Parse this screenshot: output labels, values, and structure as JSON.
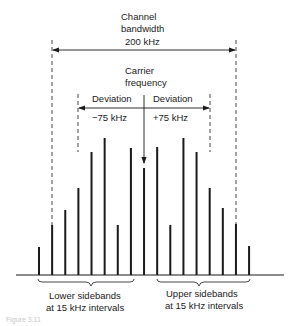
{
  "diagram": {
    "title_lines": [
      "Channel",
      "bandwidth",
      "200 kHz"
    ],
    "carrier_lines": [
      "Carrier",
      "frequency"
    ],
    "deviation_left": "Deviation",
    "deviation_right": "Deviation",
    "deviation_left_value": "−75 kHz",
    "deviation_right_value": "+75 kHz",
    "lower_sidebands_lines": [
      "Lower sidebands",
      "at 15 kHz intervals"
    ],
    "upper_sidebands_lines": [
      "Upper sidebands",
      "at 15 kHz intervals"
    ],
    "caption": "Figure 3.11",
    "colors": {
      "ink": "#1a1a1a",
      "caption": "#c8c8c8",
      "background": "#ffffff"
    }
  },
  "chart_data": {
    "type": "bar",
    "xlabel": "Frequency (15 kHz intervals)",
    "ylabel": "Relative amplitude",
    "categories": [
      "-8",
      "-7",
      "-6",
      "-5",
      "-4",
      "-3",
      "-2",
      "-1",
      "0",
      "+1",
      "+2",
      "+3",
      "+4",
      "+5",
      "+6",
      "+7",
      "+8"
    ],
    "values": [
      28,
      50,
      65,
      87,
      123,
      137,
      50,
      127,
      107,
      128,
      50,
      137,
      123,
      87,
      67,
      51,
      29
    ],
    "carrier_index": 8,
    "annotations": [
      "Channel bandwidth 200 kHz",
      "Deviation −75 kHz",
      "Deviation +75 kHz",
      "Carrier frequency"
    ]
  }
}
